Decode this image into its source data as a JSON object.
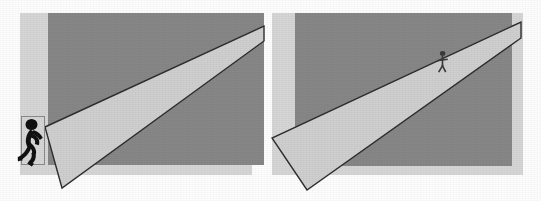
{
  "figure": {
    "canvas": {
      "width": 541,
      "height": 201,
      "background": "#fdfdfd"
    },
    "palette": {
      "page_background": "#fdfdfd",
      "wall_light": "#d6d6d6",
      "wall_dark": "#878787",
      "beam_fill": "#cfcfcf",
      "beam_outline": "#2e2e2e",
      "figure_silhouette": "#111111",
      "frame_outline": "#8a8a8a"
    },
    "panels": [
      {
        "id": "panel-left",
        "label": "Near source panel",
        "caption": "",
        "background_plane": {
          "name": "light-wall-strip",
          "x": 20,
          "y": 13,
          "width": 232,
          "height": 162,
          "color": "#d6d6d6"
        },
        "dark_plane": {
          "name": "dark-wall",
          "x": 48,
          "y": 13,
          "width": 216,
          "height": 152,
          "color": "#878787"
        },
        "beam": {
          "name": "light-cone",
          "description": "Narrow wedge widening from lower-left apex toward the upper-right edge",
          "points": "45,127 264,26 264,41 62,188",
          "fill": "#cfcfcf",
          "outline": "#2e2e2e",
          "outline_width": 1.4,
          "apex": {
            "x": 62,
            "y": 188
          }
        },
        "figure": {
          "name": "runner-silhouette-near",
          "pose": "running",
          "size": "large",
          "bounds": {
            "x": 21,
            "y": 116,
            "width": 24,
            "height": 49
          },
          "color": "#111111",
          "framed": true,
          "frame_color": "#8a8a8a"
        }
      },
      {
        "id": "panel-right",
        "label": "Far source panel",
        "caption": "",
        "background_plane": {
          "name": "light-wall-strip",
          "x": 272,
          "y": 13,
          "width": 251,
          "height": 162,
          "color": "#d6d6d6"
        },
        "dark_plane": {
          "name": "dark-wall",
          "x": 295,
          "y": 13,
          "width": 217,
          "height": 153,
          "color": "#878787"
        },
        "beam": {
          "name": "light-cone",
          "description": "Wide wedge widening from the upper-right edge down to the lower-left corner",
          "points": "521,22 521,38 307,190 272,138",
          "fill": "#cfcfcf",
          "outline": "#2e2e2e",
          "outline_width": 1.4,
          "apex": {
            "x": 521,
            "y": 30
          }
        },
        "figure": {
          "name": "runner-silhouette-far",
          "pose": "running",
          "size": "small",
          "bounds": {
            "x": 437,
            "y": 51,
            "width": 12,
            "height": 22
          },
          "color": "#3a3a3a",
          "framed": false,
          "frame_color": "#8a8a8a"
        }
      }
    ]
  }
}
